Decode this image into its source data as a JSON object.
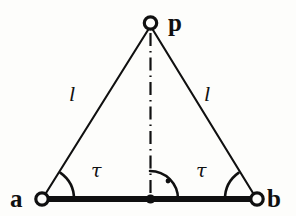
{
  "figure": {
    "type": "geometry-diagram",
    "background_color": "#fdfdfb",
    "stroke_color": "#101010"
  },
  "labels": {
    "vertex_left": "a",
    "vertex_right": "b",
    "vertex_apex": "p",
    "side_left": "l",
    "side_right": "l",
    "angle_left": "τ",
    "angle_right": "τ"
  },
  "geometry": {
    "points": {
      "a": {
        "x": 42,
        "y": 199
      },
      "b": {
        "x": 257,
        "y": 199
      },
      "p": {
        "x": 150,
        "y": 23
      },
      "midpoint": {
        "x": 150,
        "y": 199
      }
    },
    "markers": {
      "a": "open-circle",
      "b": "open-circle",
      "p": "open-circle",
      "midpoint": "filled-dot"
    },
    "baseline": {
      "from": "a",
      "to": "b",
      "style": "thick-solid",
      "width": 6
    },
    "legs": [
      {
        "from": "a",
        "to": "p",
        "style": "thin-solid",
        "width": 2,
        "label": "l"
      },
      {
        "from": "b",
        "to": "p",
        "style": "thin-solid",
        "width": 2,
        "label": "l"
      }
    ],
    "altitude": {
      "from": "p",
      "to": "midpoint",
      "style": "dash-dot",
      "width": 2
    },
    "angle_arcs": [
      {
        "at": "a",
        "radius": 32,
        "label": "τ"
      },
      {
        "at": "b",
        "radius": 32,
        "label": "τ"
      },
      {
        "at": "midpoint",
        "radius": 28,
        "label": "right-angle",
        "has_dot": true
      }
    ]
  }
}
